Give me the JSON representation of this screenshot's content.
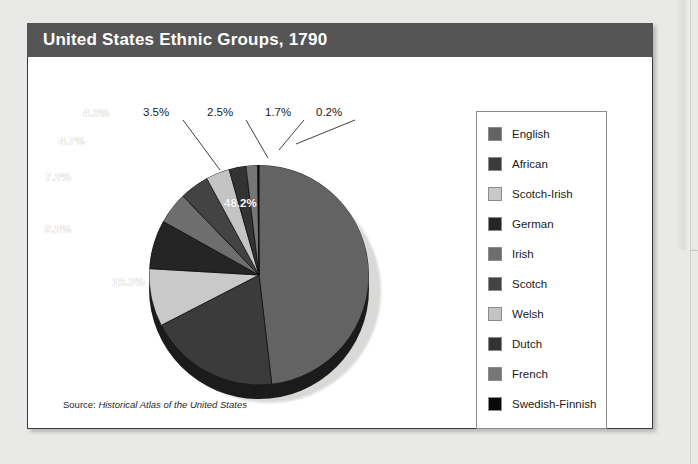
{
  "card": {
    "title": "United States Ethnic Groups, 1790",
    "title_bar_color": "#555555",
    "background": "#ffffff",
    "border_color": "#3a3a3a"
  },
  "source": {
    "prefix": "Source:",
    "title": "Historical Atlas of the United States"
  },
  "legend": {
    "position": "right",
    "border_color": "#8d8d8d",
    "items": [
      {
        "label": "English",
        "color": "#636363"
      },
      {
        "label": "African",
        "color": "#3b3b3b"
      },
      {
        "label": "Scotch-Irish",
        "color": "#c9c9c9"
      },
      {
        "label": "German",
        "color": "#252525"
      },
      {
        "label": "Irish",
        "color": "#6e6e6e"
      },
      {
        "label": "Scotch",
        "color": "#434343"
      },
      {
        "label": "Welsh",
        "color": "#c4c4c4"
      },
      {
        "label": "Dutch",
        "color": "#333333"
      },
      {
        "label": "French",
        "color": "#767676"
      },
      {
        "label": "Swedish-Finnish",
        "color": "#0a0a0a"
      }
    ]
  },
  "chart_data": {
    "type": "pie",
    "title": "United States Ethnic Groups, 1790",
    "subtitle": "",
    "xlabel": "",
    "ylabel": "",
    "unit": "percent",
    "start_angle_deg": 0,
    "direction": "clockwise",
    "legend_position": "right",
    "grid": false,
    "categories": [
      "English",
      "African",
      "Scotch-Irish",
      "German",
      "Irish",
      "Scotch",
      "Welsh",
      "Dutch",
      "French",
      "Swedish-Finnish"
    ],
    "values": [
      48.2,
      19.3,
      8.5,
      7.2,
      4.7,
      4.3,
      3.5,
      2.5,
      1.7,
      0.2
    ],
    "labels": [
      "48.2%",
      "19.3%",
      "8.5%",
      "7.2%",
      "4.7%",
      "4.3%",
      "3.5%",
      "2.5%",
      "1.7%",
      "0.2%"
    ],
    "colors": [
      "#636363",
      "#3b3b3b",
      "#c9c9c9",
      "#252525",
      "#6e6e6e",
      "#434343",
      "#c4c4c4",
      "#333333",
      "#767676",
      "#0a0a0a"
    ],
    "inside_labels": [
      {
        "text": "48.2%",
        "x": 325,
        "y": 246
      },
      {
        "text": "19.3%",
        "x": 212,
        "y": 325
      },
      {
        "text": "8.5%",
        "x": 140,
        "y": 272
      },
      {
        "text": "7.2%",
        "x": 140,
        "y": 220
      },
      {
        "text": "4.7%",
        "x": 155,
        "y": 184
      },
      {
        "text": "4.3%",
        "x": 178,
        "y": 156
      }
    ],
    "callout_labels": [
      {
        "text": "3.5%",
        "x": 141,
        "y": 88
      },
      {
        "text": "2.5%",
        "x": 205,
        "y": 88
      },
      {
        "text": "1.7%",
        "x": 263,
        "y": 88
      },
      {
        "text": "0.2%",
        "x": 314,
        "y": 88
      }
    ]
  }
}
